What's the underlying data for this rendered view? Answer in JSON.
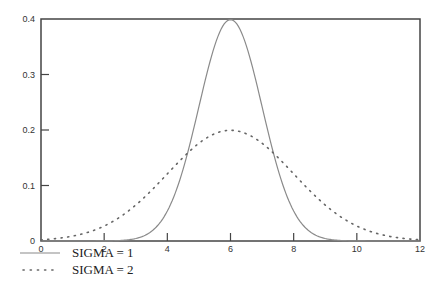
{
  "chart_data": {
    "type": "line",
    "title": "",
    "xlabel": "",
    "ylabel": "",
    "xlim": [
      0,
      12
    ],
    "ylim": [
      0,
      0.4
    ],
    "x_ticks": [
      0,
      2,
      4,
      6,
      8,
      10,
      12
    ],
    "x_tick_labels": [
      "0",
      "2",
      "4",
      "6",
      "8",
      "10",
      "12"
    ],
    "y_ticks": [
      0,
      0.1,
      0.2,
      0.3,
      0.4
    ],
    "y_tick_labels": [
      "0",
      "0.1",
      "0.2",
      "0.3",
      "0.4"
    ],
    "grid": false,
    "legend_position": "below-left",
    "series": [
      {
        "name": "SIGMA = 1",
        "style": "solid",
        "color": "#8a8a8a",
        "mean": 6,
        "sigma": 1,
        "x": [
          0,
          1,
          2,
          3,
          3.5,
          4,
          4.5,
          5,
          5.5,
          6,
          6.5,
          7,
          7.5,
          8,
          8.5,
          9,
          10,
          11,
          12
        ],
        "values": [
          0.0,
          0.0,
          0.0001,
          0.0044,
          0.0175,
          0.054,
          0.1295,
          0.242,
          0.3521,
          0.3989,
          0.3521,
          0.242,
          0.1295,
          0.054,
          0.0175,
          0.0044,
          0.0001,
          0.0,
          0.0
        ]
      },
      {
        "name": "SIGMA = 2",
        "style": "dotted",
        "color": "#666666",
        "mean": 6,
        "sigma": 2,
        "x": [
          0,
          1,
          2,
          3,
          4,
          5,
          6,
          7,
          8,
          9,
          10,
          11,
          12
        ],
        "values": [
          0.0022,
          0.0088,
          0.027,
          0.0648,
          0.121,
          0.176,
          0.1995,
          0.176,
          0.121,
          0.0648,
          0.027,
          0.0088,
          0.0022
        ]
      }
    ]
  },
  "legend": {
    "items": [
      {
        "label": "SIGMA = 1",
        "style": "solid"
      },
      {
        "label": "SIGMA = 2",
        "style": "dotted"
      }
    ]
  }
}
